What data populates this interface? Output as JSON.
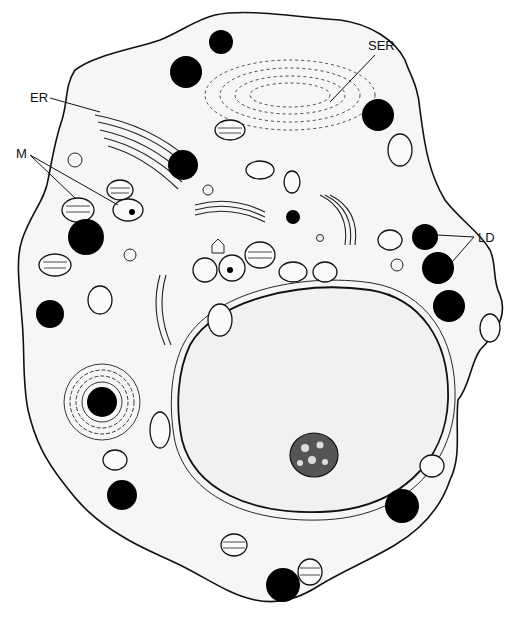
{
  "figure": {
    "type": "cell ultrastructure illustration",
    "style": "black-and-white stippled line drawing",
    "background": "#ffffff",
    "ink_color": "#000000"
  },
  "labels": {
    "ser": "SER",
    "er": "ER",
    "m": "M",
    "ld": "LD"
  },
  "structures": {
    "cell_outline": "irregular cell membrane",
    "nucleus": "large oval stippled nucleus (lower right)",
    "nucleolus": "dark reticulated nucleolus inside nucleus",
    "lipid_droplets_count": 14,
    "label_leaders": {
      "SER": 1,
      "ER": 1,
      "M": 2,
      "LD": 2
    }
  }
}
